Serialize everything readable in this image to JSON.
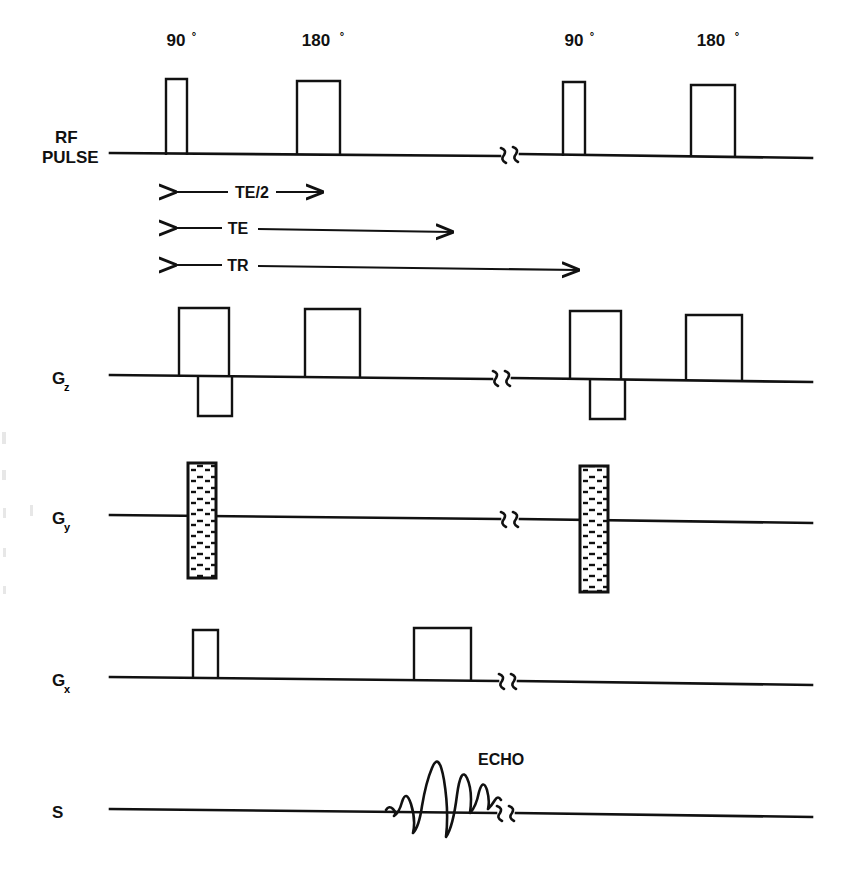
{
  "figure": {
    "type": "mri-pulse-sequence-diagram"
  },
  "rows": [
    {
      "id": "rf",
      "label": "RF",
      "label_line2": "PULSE",
      "baseline_y": 155
    },
    {
      "id": "gz",
      "label": "G",
      "subscript": "z",
      "baseline_y": 378
    },
    {
      "id": "gy",
      "label": "G",
      "subscript": "y",
      "baseline_y": 518
    },
    {
      "id": "gx",
      "label": "G",
      "subscript": "x",
      "baseline_y": 680
    },
    {
      "id": "s",
      "label": "S",
      "subscript": "",
      "baseline_y": 812
    }
  ],
  "rf_pulses": [
    {
      "label": "90",
      "degree": "°",
      "x": 166,
      "width": 21,
      "height": 76,
      "label_x": 176,
      "label_y": 46
    },
    {
      "label": "180",
      "degree": "°",
      "x": 297,
      "width": 43,
      "height": 74,
      "label_x": 318,
      "label_y": 46
    },
    {
      "label": "90",
      "degree": "°",
      "x": 563,
      "width": 22,
      "height": 74,
      "label_x": 574,
      "label_y": 46
    },
    {
      "label": "180",
      "degree": "°",
      "x": 691,
      "width": 44,
      "height": 72,
      "label_x": 713,
      "label_y": 46
    }
  ],
  "timing_arrows": [
    {
      "label": "TE/2",
      "x1": 175,
      "x2": 322,
      "y": 192,
      "label_x": 250,
      "label_y": 198
    },
    {
      "label": "TE",
      "x1": 175,
      "x2": 452,
      "y": 228,
      "label_x": 236,
      "label_y": 234
    },
    {
      "label": "TR",
      "x1": 175,
      "x2": 578,
      "y": 265,
      "label_x": 236,
      "label_y": 271
    }
  ],
  "gz_pulses": [
    {
      "polarity": "positive",
      "x": 179,
      "width": 50,
      "height": 68
    },
    {
      "polarity": "negative",
      "x": 198,
      "width": 34,
      "height": 39
    },
    {
      "polarity": "positive",
      "x": 305,
      "width": 55,
      "height": 68
    },
    {
      "polarity": "positive",
      "x": 570,
      "width": 51,
      "height": 68
    },
    {
      "polarity": "negative",
      "x": 590,
      "width": 35,
      "height": 39
    },
    {
      "polarity": "positive",
      "x": 686,
      "width": 56,
      "height": 66
    }
  ],
  "gy_pulses": [
    {
      "x": 188,
      "width": 28,
      "top": 463,
      "bottom": 578,
      "fill": "hatched"
    },
    {
      "x": 580,
      "width": 28,
      "top": 466,
      "bottom": 592,
      "fill": "hatched"
    }
  ],
  "gx_pulses": [
    {
      "x": 193,
      "width": 25,
      "height": 48
    },
    {
      "x": 414,
      "width": 57,
      "height": 52
    }
  ],
  "echo": {
    "label": "ECHO",
    "label_x": 478,
    "label_y": 765,
    "center_x": 437,
    "peak_height": 62
  },
  "break_marks": [
    {
      "row": "rf",
      "x": 508,
      "y": 155
    },
    {
      "row": "gz",
      "x": 500,
      "y": 378
    },
    {
      "row": "gy",
      "x": 508,
      "y": 518
    },
    {
      "row": "gx",
      "x": 506,
      "y": 680
    },
    {
      "row": "s",
      "x": 504,
      "y": 812
    }
  ],
  "axis": {
    "x_start": 110,
    "x_end": 812
  },
  "colors": {
    "ink": "#111111",
    "background": "#ffffff"
  }
}
